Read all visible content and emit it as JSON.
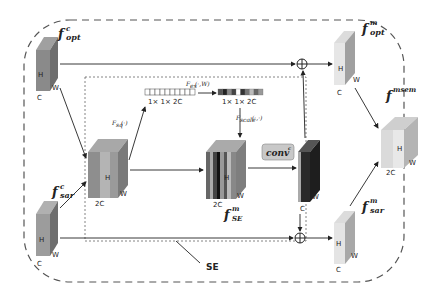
{
  "labels": {
    "f_opt_c": {
      "base": "f",
      "sup": "c",
      "sub": "opt"
    },
    "f_sar_c": {
      "base": "f",
      "sup": "c",
      "sub": "sar"
    },
    "f_opt_m": {
      "base": "f",
      "sup": "m",
      "sub": "opt"
    },
    "f_sar_m": {
      "base": "f",
      "sup": "m",
      "sub": "sar"
    },
    "f_se_m": {
      "base": "f",
      "sup": "m",
      "sub": "SE"
    },
    "f_msem": {
      "base": "f",
      "sup": "msem",
      "sub": ""
    },
    "f_sq": "Fₛᵩ(·)",
    "f_sq_text": "Fsq(·)",
    "f_ex": "Fex(·,W)",
    "f_scale": "Fscale(·,·)",
    "conv": "conv",
    "conv_sup": "c",
    "vec1_dim": "1× 1× 2C",
    "vec2_dim": "1× 1× 2C",
    "se_label": "SE"
  },
  "dims": {
    "H": "H",
    "W": "W",
    "C": "C",
    "2C": "2C"
  },
  "colors": {
    "opt_c_front": "#8a8a8a",
    "opt_c_side": "#6e6e6e",
    "sar_c_front": "#9c9c9c",
    "sar_c_side": "#777777",
    "concat_a": "#8e8e8e",
    "concat_b": "#b0b0b0",
    "concat_side": "#7a7a7a",
    "conv_box": "#c8c8c8",
    "out_dark": "#2a2a2a",
    "m_front": "#e4e4e4",
    "m_side": "#a8a8a8",
    "msem_front": "#dcdcdc",
    "msem_side": "#bdbdbd",
    "line": "#222222",
    "dash": "#555555"
  },
  "vec_excited_cells": [
    "#555",
    "#222",
    "#888",
    "#444",
    "#fff",
    "#333",
    "#777",
    "#bbb",
    "#666",
    "#999"
  ]
}
